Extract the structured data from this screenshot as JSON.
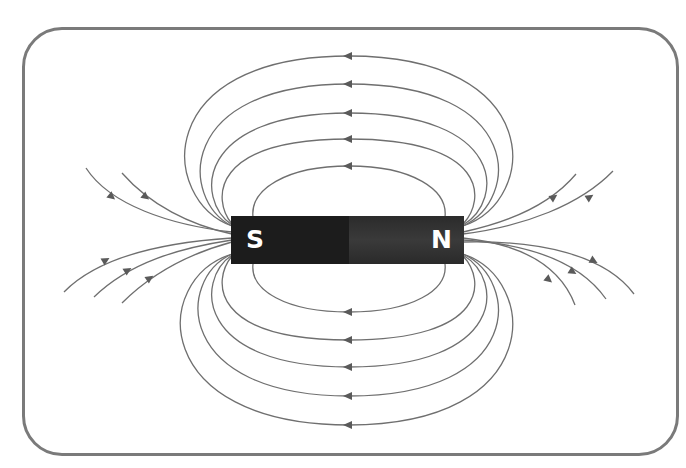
{
  "diagram": {
    "magnet": {
      "south_label": "S",
      "north_label": "N",
      "south_color": "#1c1c1c",
      "north_color": "#333333"
    },
    "field_line_color": "#6f6f6f",
    "frame_color": "#7a7a7a",
    "closed_loops_above": 5,
    "closed_loops_below": 5,
    "open_lines_left": 5,
    "open_lines_right": 5,
    "arrow_direction": "N to S outside magnet (leftward on loops)"
  }
}
